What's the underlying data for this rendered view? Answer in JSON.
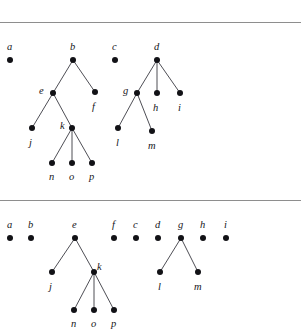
{
  "figure": {
    "ghost_header": "",
    "separators": [
      {
        "name": "top-rule",
        "y": 22
      },
      {
        "name": "middle-rule",
        "y": 200
      }
    ],
    "panels": [
      {
        "id": "upper-forest",
        "caption": "",
        "nodes": [
          {
            "id": "a",
            "label": "a",
            "x": 10,
            "y": 60,
            "lx": 7,
            "ly": 42
          },
          {
            "id": "b",
            "label": "b",
            "x": 73,
            "y": 60,
            "lx": 70,
            "ly": 42
          },
          {
            "id": "c",
            "label": "c",
            "x": 115,
            "y": 60,
            "lx": 112,
            "ly": 42
          },
          {
            "id": "d",
            "label": "d",
            "x": 157,
            "y": 60,
            "lx": 154,
            "ly": 42
          },
          {
            "id": "e",
            "label": "e",
            "x": 53,
            "y": 93,
            "lx": 39,
            "ly": 86
          },
          {
            "id": "f",
            "label": "f",
            "x": 95,
            "y": 92,
            "lx": 92,
            "ly": 102
          },
          {
            "id": "g",
            "label": "g",
            "x": 137,
            "y": 93,
            "lx": 123,
            "ly": 86
          },
          {
            "id": "h",
            "label": "h",
            "x": 157,
            "y": 93,
            "lx": 153,
            "ly": 103
          },
          {
            "id": "i",
            "label": "i",
            "x": 180,
            "y": 93,
            "lx": 178,
            "ly": 103
          },
          {
            "id": "j",
            "label": "j",
            "x": 32,
            "y": 128,
            "lx": 29,
            "ly": 138
          },
          {
            "id": "k",
            "label": "k",
            "x": 72,
            "y": 128,
            "lx": 60,
            "ly": 121
          },
          {
            "id": "l",
            "label": "l",
            "x": 118,
            "y": 128,
            "lx": 116,
            "ly": 138
          },
          {
            "id": "m",
            "label": "m",
            "x": 152,
            "y": 131,
            "lx": 148,
            "ly": 141
          },
          {
            "id": "n",
            "label": "n",
            "x": 52,
            "y": 163,
            "lx": 49,
            "ly": 172
          },
          {
            "id": "o",
            "label": "o",
            "x": 72,
            "y": 163,
            "lx": 69,
            "ly": 172
          },
          {
            "id": "p",
            "label": "p",
            "x": 92,
            "y": 163,
            "lx": 89,
            "ly": 172
          }
        ],
        "edges": [
          {
            "from": "b",
            "to": "e"
          },
          {
            "from": "b",
            "to": "f"
          },
          {
            "from": "d",
            "to": "g"
          },
          {
            "from": "d",
            "to": "h"
          },
          {
            "from": "d",
            "to": "i"
          },
          {
            "from": "e",
            "to": "j"
          },
          {
            "from": "e",
            "to": "k"
          },
          {
            "from": "g",
            "to": "l"
          },
          {
            "from": "g",
            "to": "m"
          },
          {
            "from": "k",
            "to": "n"
          },
          {
            "from": "k",
            "to": "o"
          },
          {
            "from": "k",
            "to": "p"
          }
        ]
      },
      {
        "id": "lower-forest",
        "caption": "",
        "nodes": [
          {
            "id": "a2",
            "label": "a",
            "x": 10,
            "y": 238,
            "lx": 7,
            "ly": 220
          },
          {
            "id": "b2",
            "label": "b",
            "x": 31,
            "y": 238,
            "lx": 28,
            "ly": 220
          },
          {
            "id": "e2",
            "label": "e",
            "x": 75,
            "y": 238,
            "lx": 72,
            "ly": 220
          },
          {
            "id": "f2",
            "label": "f",
            "x": 114,
            "y": 238,
            "lx": 112,
            "ly": 220
          },
          {
            "id": "c2",
            "label": "c",
            "x": 136,
            "y": 238,
            "lx": 133,
            "ly": 220
          },
          {
            "id": "d2",
            "label": "d",
            "x": 158,
            "y": 238,
            "lx": 155,
            "ly": 220
          },
          {
            "id": "g2",
            "label": "g",
            "x": 181,
            "y": 238,
            "lx": 178,
            "ly": 220
          },
          {
            "id": "h2",
            "label": "h",
            "x": 203,
            "y": 238,
            "lx": 200,
            "ly": 220
          },
          {
            "id": "i2",
            "label": "i",
            "x": 226,
            "y": 238,
            "lx": 224,
            "ly": 220
          },
          {
            "id": "j2",
            "label": "j",
            "x": 52,
            "y": 272,
            "lx": 49,
            "ly": 282
          },
          {
            "id": "k2",
            "label": "k",
            "x": 94,
            "y": 272,
            "lx": 97,
            "ly": 262
          },
          {
            "id": "l2",
            "label": "l",
            "x": 160,
            "y": 272,
            "lx": 158,
            "ly": 282
          },
          {
            "id": "m2",
            "label": "m",
            "x": 198,
            "y": 272,
            "lx": 194,
            "ly": 282
          },
          {
            "id": "n2",
            "label": "n",
            "x": 74,
            "y": 310,
            "lx": 71,
            "ly": 319
          },
          {
            "id": "o2",
            "label": "o",
            "x": 94,
            "y": 310,
            "lx": 91,
            "ly": 319
          },
          {
            "id": "p2",
            "label": "p",
            "x": 114,
            "y": 310,
            "lx": 111,
            "ly": 319
          }
        ],
        "edges": [
          {
            "from": "e2",
            "to": "j2"
          },
          {
            "from": "e2",
            "to": "k2"
          },
          {
            "from": "g2",
            "to": "l2"
          },
          {
            "from": "g2",
            "to": "m2"
          },
          {
            "from": "k2",
            "to": "n2"
          },
          {
            "from": "k2",
            "to": "o2"
          },
          {
            "from": "k2",
            "to": "p2"
          }
        ]
      }
    ],
    "colors": {
      "node": "#121216",
      "edge": "#3a3a42",
      "rule": "#8e8e8e",
      "label": "#16161a",
      "background": "#ffffff"
    }
  }
}
